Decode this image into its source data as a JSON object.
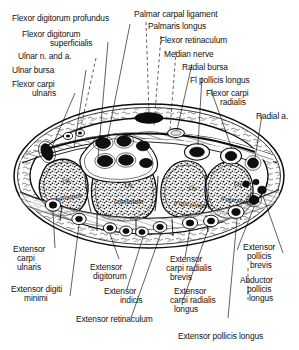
{
  "figure": {
    "view": "transverse section, distal carpal row",
    "line_color": "#0d0d0d",
    "background_color": "#ffffff"
  },
  "labels_top_left": [
    {
      "id": "flexor-digitorum-profundus",
      "text": "Flexor digitorum profundus"
    },
    {
      "id": "flexor-digitorum-superficialis",
      "line1": "Flexor digitorum",
      "line2": "superficialis"
    },
    {
      "id": "ulnar-n-and-a",
      "text": "Ulnar n. and a."
    },
    {
      "id": "ulnar-bursa",
      "text": "Ulnar bursa"
    },
    {
      "id": "flexor-carpi-ulnaris",
      "line1": "Flexor carpi",
      "line2": "ulnaris"
    }
  ],
  "labels_top_right": [
    {
      "id": "palmar-carpal-ligament",
      "text": "Palmar carpal ligament"
    },
    {
      "id": "palmaris-longus",
      "text": "Palmaris longus"
    },
    {
      "id": "flexor-retinaculum",
      "text": "Flexor retinaculum"
    },
    {
      "id": "median-nerve",
      "text": "Median nerve"
    },
    {
      "id": "radial-bursa",
      "text": "Radial bursa"
    },
    {
      "id": "fl-pollicis-longus",
      "text": "Fl pollicis longus"
    },
    {
      "id": "flexor-carpi-radialis",
      "line1": "Flexor carpi",
      "line2": "radialis"
    },
    {
      "id": "radial-a",
      "text": "Radial a."
    }
  ],
  "labels_bottom_left": [
    {
      "id": "extensor-carpi-ulnaris",
      "line1": "Extensor",
      "line2": "carpi",
      "line3": "ulnaris"
    },
    {
      "id": "extensor-digiti-minimi",
      "line1": "Extensor digiti",
      "line2": "minimi"
    },
    {
      "id": "extensor-digitorum",
      "line1": "Extensor",
      "line2": "digitorum"
    },
    {
      "id": "extensor-indicis",
      "line1": "Extensor",
      "line2": "indicis"
    },
    {
      "id": "extensor-retinaculum",
      "text": "Extensor retinaculum"
    }
  ],
  "labels_bottom_right": [
    {
      "id": "extensor-carpi-radialis-brevis",
      "line1": "Extensor",
      "line2": "carpi radialis",
      "line3": "brevis"
    },
    {
      "id": "extensor-carpi-radialis-longus",
      "line1": "Extensor",
      "line2": "carpi radialis",
      "line3": "longus"
    },
    {
      "id": "extensor-pollicis-brevis",
      "line1": "Extensor",
      "line2": "pollicis",
      "line3": "brevis"
    },
    {
      "id": "abductor-pollicis-longus",
      "line1": "Abductor",
      "line2": "pollicis",
      "line3": "longus"
    },
    {
      "id": "extensor-pollicis-longus",
      "text": "Extensor pollicis longus"
    }
  ],
  "bone_labels": [
    {
      "id": "os-hamatum",
      "line1": "Os",
      "line2": "hamatum"
    },
    {
      "id": "os-capitatum",
      "line1": "Os",
      "line2": "capitatum"
    },
    {
      "id": "os-trapezoides",
      "line1": "Os",
      "line2": "trapezoides"
    },
    {
      "id": "os-trapezium",
      "line1": "Os",
      "line2": "trapezium"
    }
  ]
}
